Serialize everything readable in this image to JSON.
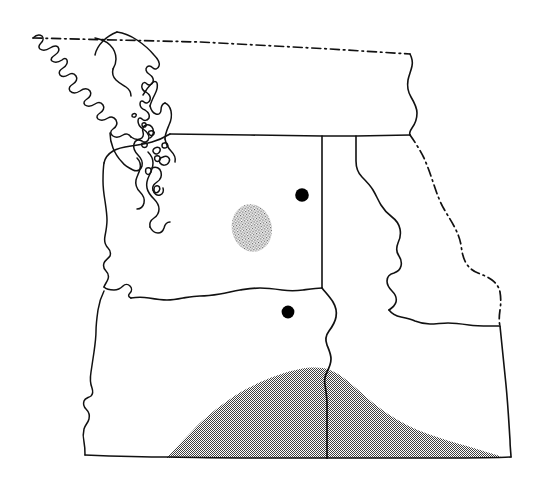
{
  "figure": {
    "name": "pacific-northwest-distribution-map",
    "background_color": "#ffffff",
    "line_color": "#111111",
    "marker_color": "#000000",
    "stipple_color": "#4a4a4a",
    "width": 544,
    "height": 487
  },
  "map_data": {
    "type": "outline-map",
    "region": "Pacific Northwest",
    "projection_note": "unlabeled outline map, no scale bar, no graticule, no legend, no text labels",
    "areas": [
      {
        "name": "british-columbia-coast",
        "style": "solid-outline",
        "description": "coastline with Vancouver Island, Haida Gwaii and mainland inlets, upper left"
      },
      {
        "name": "washington",
        "style": "solid-outline",
        "description": "state outline with Puget Sound and Pacific coast"
      },
      {
        "name": "oregon",
        "style": "solid-outline",
        "description": "state outline south of the Columbia River"
      },
      {
        "name": "idaho",
        "style": "solid-outline",
        "description": "state outline including northern panhandle"
      }
    ],
    "boundaries": [
      {
        "name": "canada-united-states-border",
        "style": "dash-dot",
        "description": "49th parallel across the top of the map"
      },
      {
        "name": "idaho-montana-border",
        "style": "dash-dot",
        "description": "continental divide, right side of map"
      },
      {
        "name": "washington-idaho-border",
        "style": "solid",
        "description": "near vertical line, center of map"
      },
      {
        "name": "washington-oregon-border",
        "style": "solid",
        "description": "Columbia River, center-left of map"
      },
      {
        "name": "oregon-idaho-border",
        "style": "solid",
        "description": "Snake River, lower center of map"
      }
    ],
    "point_markers": [
      {
        "name": "locality-marker-1",
        "label": "",
        "symbol": "filled-circle",
        "x": 302,
        "y": 195,
        "radius": 6.8,
        "region": "central Washington"
      },
      {
        "name": "locality-marker-2",
        "label": "",
        "symbol": "filled-circle",
        "x": 288,
        "y": 312,
        "radius": 6.4,
        "region": "north-central Oregon"
      }
    ],
    "shaded_regions": [
      {
        "name": "stipple-patch-central-washington",
        "symbol": "stipple",
        "center_x": 252,
        "center_y": 228,
        "approx_width": 40,
        "approx_height": 48,
        "region": "central Washington",
        "description": "small isolated stippled oval"
      },
      {
        "name": "stipple-patch-southern-range",
        "symbol": "stipple",
        "region": "southern Oregon and southern Idaho",
        "approx_x_extent": [
          165,
          500
        ],
        "approx_y_extent": [
          370,
          458
        ],
        "description": "large continuous stippled band along the southern border"
      }
    ],
    "legend": {
      "present": false,
      "entries": []
    },
    "scale_bar": {
      "present": false
    }
  }
}
